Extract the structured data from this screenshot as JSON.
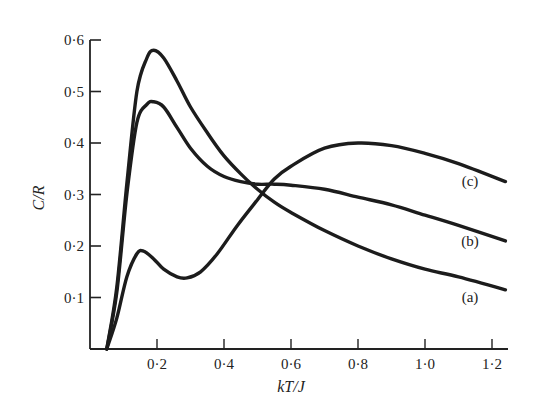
{
  "chart_data": {
    "type": "line",
    "title": "",
    "xlabel": "kT/J",
    "ylabel": "C/R",
    "xlim": [
      0,
      1.25
    ],
    "ylim": [
      0,
      0.6
    ],
    "grid": false,
    "legend": "inline labels at right end of curves",
    "x_ticks": [
      0.2,
      0.4,
      0.6,
      0.8,
      1.0,
      1.2
    ],
    "x_tick_labels": [
      "0·2",
      "0·4",
      "0·6",
      "0·8",
      "1·0",
      "1·2"
    ],
    "y_ticks": [
      0.1,
      0.2,
      0.3,
      0.4,
      0.5,
      0.6
    ],
    "y_tick_labels": [
      "0·1",
      "0·2",
      "0·3",
      "0·4",
      "0·5",
      "0·6"
    ],
    "series": [
      {
        "name": "(a)",
        "x": [
          0.05,
          0.08,
          0.11,
          0.14,
          0.17,
          0.19,
          0.22,
          0.26,
          0.3,
          0.35,
          0.4,
          0.45,
          0.5,
          0.55,
          0.6,
          0.7,
          0.8,
          0.9,
          1.0,
          1.1,
          1.24
        ],
        "y": [
          0.0,
          0.12,
          0.32,
          0.5,
          0.565,
          0.58,
          0.565,
          0.52,
          0.47,
          0.42,
          0.375,
          0.34,
          0.31,
          0.285,
          0.265,
          0.23,
          0.2,
          0.175,
          0.155,
          0.14,
          0.115
        ]
      },
      {
        "name": "(b)",
        "x": [
          0.05,
          0.08,
          0.11,
          0.14,
          0.17,
          0.19,
          0.22,
          0.26,
          0.3,
          0.35,
          0.4,
          0.45,
          0.5,
          0.55,
          0.6,
          0.7,
          0.8,
          0.9,
          1.0,
          1.1,
          1.24
        ],
        "y": [
          0.0,
          0.11,
          0.3,
          0.44,
          0.475,
          0.48,
          0.47,
          0.43,
          0.39,
          0.355,
          0.335,
          0.325,
          0.32,
          0.32,
          0.318,
          0.31,
          0.295,
          0.28,
          0.26,
          0.24,
          0.21
        ]
      },
      {
        "name": "(c)",
        "x": [
          0.05,
          0.08,
          0.11,
          0.14,
          0.16,
          0.19,
          0.22,
          0.26,
          0.29,
          0.33,
          0.38,
          0.44,
          0.5,
          0.55,
          0.6,
          0.7,
          0.8,
          0.9,
          1.0,
          1.1,
          1.24
        ],
        "y": [
          0.0,
          0.06,
          0.14,
          0.185,
          0.19,
          0.175,
          0.155,
          0.14,
          0.138,
          0.15,
          0.185,
          0.24,
          0.29,
          0.33,
          0.355,
          0.39,
          0.4,
          0.395,
          0.38,
          0.36,
          0.325
        ]
      }
    ]
  },
  "axes": {
    "xlabel_prefix": "kT",
    "xlabel_sep": "/",
    "xlabel_suffix": "J",
    "ylabel": "C/R"
  }
}
